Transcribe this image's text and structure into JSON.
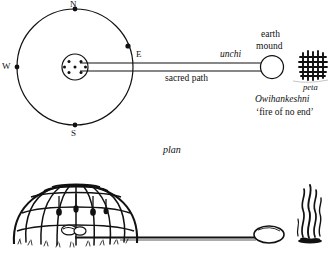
{
  "figure": {
    "title_caption": "plan"
  },
  "plan": {
    "compass": {
      "north": "N",
      "west": "W",
      "south": "S",
      "east": "E"
    },
    "labels": {
      "unchi": "unchi",
      "earth_mound_line1": "earth",
      "earth_mound_line2": "mound",
      "sacred_path": "sacred path",
      "peta": "peta",
      "owihankeshni": "Owihankeshni",
      "fire_of_no_end": "‘fire of no end’"
    },
    "geometry": {
      "circle_center_x": 75,
      "circle_center_y": 67,
      "circle_radius": 58,
      "fireplace_center_x": 75,
      "fireplace_center_y": 67,
      "fireplace_radius": 13,
      "fireplace_dot_count": 7,
      "path_start_x": 88,
      "path_end_x": 261,
      "path_top_y": 63,
      "path_bottom_y": 71,
      "mound_center_x": 272,
      "mound_center_y": 67,
      "mound_radius": 11,
      "peta_grid_x": 300,
      "peta_grid_y": 55,
      "peta_grid_size": 24,
      "peta_grid_lines": 6
    },
    "icons": {
      "compass_marker": "compass-dot",
      "fireplace": "fireplace-stones",
      "peta_symbol": "crosshatch-fire-grid"
    }
  },
  "elevation": {
    "icons": {
      "lodge": "dome-lodge-frame",
      "mound": "oval-earth-mound",
      "fire": "smoke-flame"
    },
    "geometry": {
      "lodge_center_x": 75,
      "lodge_base_y": 245,
      "lodge_width": 128,
      "lodge_height": 62,
      "path_y": 238,
      "path_start_x": 75,
      "path_end_x": 258,
      "mound_center_x": 268,
      "mound_center_y": 235,
      "mound_rx": 14,
      "mound_ry": 9,
      "fire_x": 308,
      "fire_base_y": 242
    }
  },
  "style": {
    "ink": "#111111",
    "paper": "#ffffff",
    "stroke_width": 1.1
  }
}
